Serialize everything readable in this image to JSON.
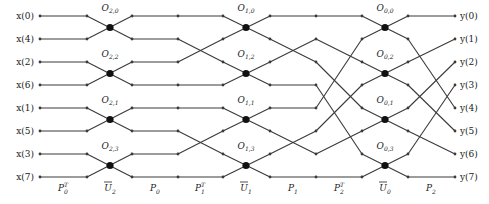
{
  "diagram": {
    "inputs": [
      "x(0)",
      "x(4)",
      "x(2)",
      "x(6)",
      "x(1)",
      "x(5)",
      "x(3)",
      "x(7)"
    ],
    "outputs": [
      "y(0)",
      "y(1)",
      "y(2)",
      "y(3)",
      "y(4)",
      "y(5)",
      "y(6)",
      "y(7)"
    ],
    "stage_labels": [
      {
        "base": "P",
        "sub": "0",
        "sup": "T"
      },
      {
        "base": "U",
        "sub": "2",
        "bar": true
      },
      {
        "base": "P",
        "sub": "0"
      },
      {
        "base": "P",
        "sub": "1",
        "sup": "T"
      },
      {
        "base": "U",
        "sub": "1",
        "bar": true
      },
      {
        "base": "P",
        "sub": "1"
      },
      {
        "base": "P",
        "sub": "2",
        "sup": "T"
      },
      {
        "base": "U",
        "sub": "0",
        "bar": true
      },
      {
        "base": "P",
        "sub": "2"
      }
    ],
    "butterfly_stages": [
      {
        "stage": "U2",
        "ops": [
          "2,0",
          "2,2",
          "2,1",
          "2,3"
        ]
      },
      {
        "stage": "U1",
        "ops": [
          "1,0",
          "1,2",
          "1,1",
          "1,3"
        ]
      },
      {
        "stage": "U0",
        "ops": [
          "0,0",
          "0,2",
          "0,1",
          "0,3"
        ]
      }
    ],
    "permutations": {
      "P0T": [
        0,
        1,
        2,
        3,
        4,
        5,
        6,
        7
      ],
      "P0": [
        0,
        1,
        2,
        3,
        4,
        5,
        6,
        7
      ],
      "P1T": [
        0,
        2,
        1,
        3,
        4,
        6,
        5,
        7
      ],
      "P1": [
        0,
        2,
        1,
        3,
        4,
        6,
        5,
        7
      ],
      "P2T": [
        0,
        2,
        4,
        6,
        1,
        3,
        5,
        7
      ],
      "P2": [
        0,
        4,
        1,
        5,
        2,
        6,
        3,
        7
      ]
    },
    "colors": {
      "wire": "#3a3a3a",
      "node": "#111111",
      "background": "#ffffff"
    }
  }
}
